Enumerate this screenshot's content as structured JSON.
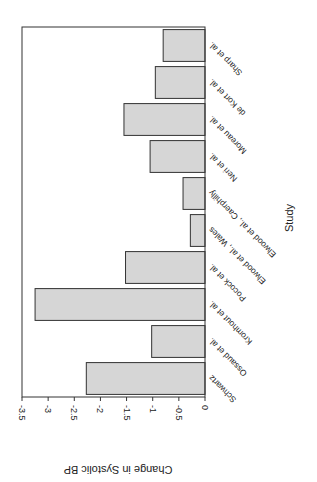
{
  "chart_data": {
    "type": "bar",
    "orientation": "rotated-180 (vertical bars rendered rotated; value axis along bottom)",
    "title": "",
    "xlabel": "Study",
    "ylabel": "Change in Systolic BP",
    "categories": [
      "Schwartz",
      "Ossaud et al.",
      "Kromhout et al.",
      "Pocock et al.",
      "Elwood et al., Wales",
      "Elwood et al., Caerphilly",
      "Neri et al.",
      "Moreau et al.",
      "de Kort et al.",
      "Sharp et al."
    ],
    "values": [
      -2.27,
      -1.02,
      -3.25,
      -1.52,
      -0.28,
      -0.42,
      -1.05,
      -1.55,
      -0.95,
      -0.8
    ],
    "yticks": [
      "-3.5",
      "-3",
      "-2.5",
      "-2",
      "-1.5",
      "-1",
      "-0.5",
      "0"
    ],
    "ylim": [
      -3.5,
      0
    ],
    "grid": false,
    "legend": null,
    "bar_color": "#d6d6d6",
    "edge_color": "#333333"
  }
}
